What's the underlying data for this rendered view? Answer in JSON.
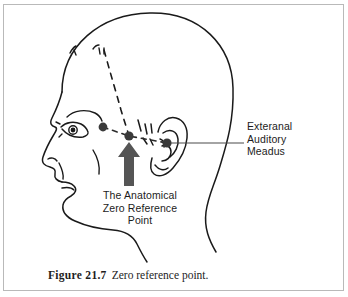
{
  "figure": {
    "caption_number": "Figure 21.7",
    "caption_text": "Zero reference point.",
    "border_color": "#b9b9b9",
    "background_color": "#ffffff"
  },
  "labels": {
    "ear": {
      "line1": "Exteranal",
      "line2": "Auditory",
      "line3": "Meadus"
    },
    "zero_point": {
      "line1": "The Anatomical",
      "line2": "Zero Reference",
      "line3": "Point"
    }
  },
  "diagram": {
    "ink_color": "#1a1a1a",
    "arrow_color": "#555555",
    "marker_color": "#3a3a3a",
    "leader_color": "#4a4a4a",
    "markers": [
      {
        "name": "outer-canthus-marker",
        "x": 103,
        "y": 127,
        "r": 4.4
      },
      {
        "name": "zero-reference-marker",
        "x": 129,
        "y": 136,
        "r": 4.6
      },
      {
        "name": "external-auditory-meatus-marker",
        "x": 167,
        "y": 143,
        "r": 4.6
      }
    ],
    "arrow": {
      "name": "zero-reference-arrow",
      "tip_x": 129,
      "tip_y": 143,
      "tail_y": 186,
      "shaft_width": 9,
      "head_width": 22
    },
    "leader_line": {
      "name": "ear-leader-line",
      "x1": 171,
      "y1": 143,
      "x2": 244,
      "y2": 143
    }
  }
}
